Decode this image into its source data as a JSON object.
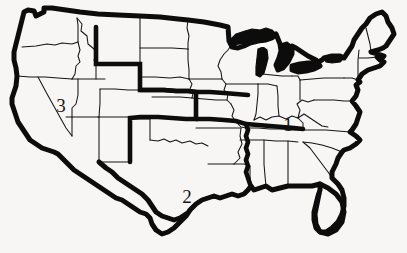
{
  "figure": {
    "kind": "us-map-regions",
    "title": "",
    "background_color": "#f7f6f4",
    "ink_color": "#0c0c0c",
    "state_line_color": "#151515"
  },
  "map": {
    "name": "united-states-contiguous",
    "description": "Outline map of the contiguous United States with state boundaries, a heavy national outline, heavy interior region-dividing lines, and the Great Lakes filled solid black.",
    "region_boundaries_bold": true,
    "great_lakes_filled": true
  },
  "labels": [
    {
      "id": "region-1",
      "text": "1",
      "x": 288,
      "y": 127
    },
    {
      "id": "region-2",
      "text": "2",
      "x": 187,
      "y": 199
    },
    {
      "id": "region-3",
      "text": "3",
      "x": 61,
      "y": 108
    }
  ],
  "legend": {
    "present": false,
    "items": []
  },
  "axes": {
    "present": false
  }
}
